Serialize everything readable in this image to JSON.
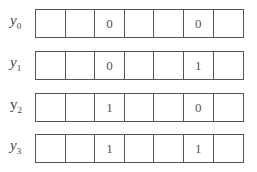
{
  "rows": [
    {
      "label": "y",
      "sub": "0",
      "top": 9,
      "cells": [
        "",
        "",
        "0",
        "",
        "",
        "0",
        ""
      ]
    },
    {
      "label": "y",
      "sub": "1",
      "top": 51,
      "cells": [
        "",
        "",
        "0",
        "",
        "",
        "1",
        ""
      ]
    },
    {
      "label": "y",
      "sub": "2",
      "top": 93,
      "cells": [
        "",
        "",
        "1",
        "",
        "",
        "0",
        ""
      ]
    },
    {
      "label": "y",
      "sub": "3",
      "top": 134,
      "cells": [
        "",
        "",
        "1",
        "",
        "",
        "1",
        ""
      ]
    }
  ]
}
